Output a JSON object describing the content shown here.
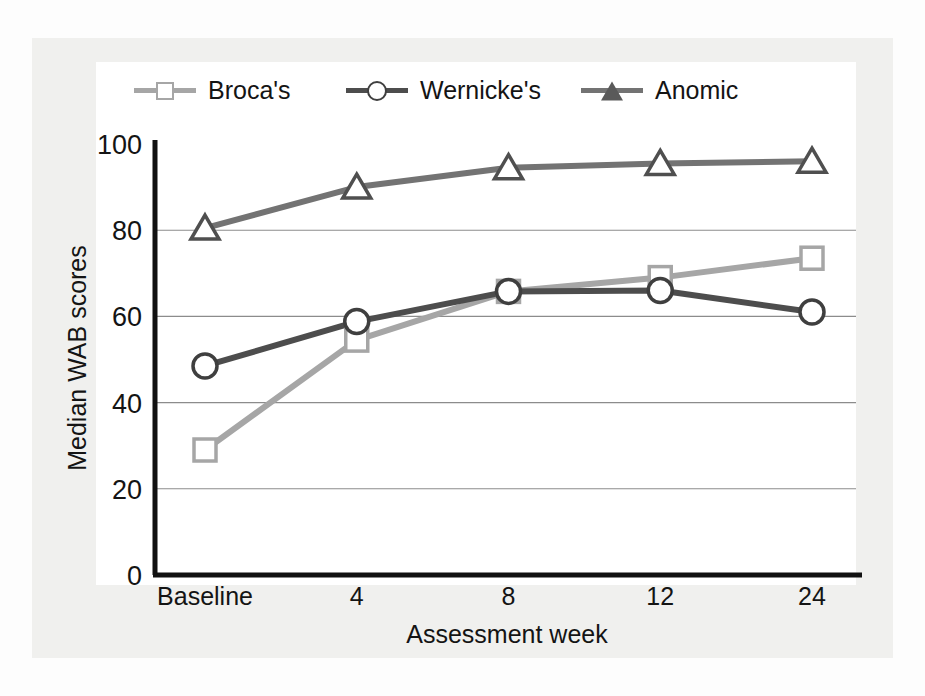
{
  "chart_data": {
    "type": "line",
    "title": "",
    "xlabel": "Assessment week",
    "ylabel": "Median WAB scores",
    "categories": [
      "Baseline",
      "4",
      "8",
      "12",
      "24"
    ],
    "yticks": [
      0,
      20,
      40,
      60,
      80,
      100
    ],
    "ylim": [
      0,
      100
    ],
    "grid": "horizontal",
    "legend_position": "top",
    "series": [
      {
        "name": "Broca's",
        "marker": "square",
        "color": "#a6a6a6",
        "values": [
          29,
          54.5,
          65.8,
          69,
          73.5
        ]
      },
      {
        "name": "Wernicke's",
        "marker": "circle",
        "color": "#4d4d4d",
        "values": [
          48.5,
          58.8,
          65.8,
          66,
          61
        ]
      },
      {
        "name": "Anomic",
        "marker": "triangle",
        "color": "#737373",
        "values": [
          80.5,
          90,
          94.5,
          95.5,
          96
        ]
      }
    ]
  },
  "legend": {
    "items": [
      {
        "label": "Broca's",
        "icon": "square-marker-icon"
      },
      {
        "label": "Wernicke's",
        "icon": "circle-marker-icon"
      },
      {
        "label": "Anomic",
        "icon": "triangle-marker-icon"
      }
    ]
  },
  "axes": {
    "y_title": "Median WAB scores",
    "x_title": "Assessment week",
    "y_labels": [
      "100",
      "80",
      "60",
      "40",
      "20",
      "0"
    ],
    "x_labels": [
      "Baseline",
      "4",
      "8",
      "12",
      "24"
    ]
  },
  "colors": {
    "brocas": "#a6a6a6",
    "wernickes": "#4d4d4d",
    "anomic": "#737373",
    "axis": "#111111",
    "grid": "#8c8c8c",
    "panel_bg": "#f0f0ee",
    "plot_bg": "#ffffff",
    "text": "#141414"
  }
}
